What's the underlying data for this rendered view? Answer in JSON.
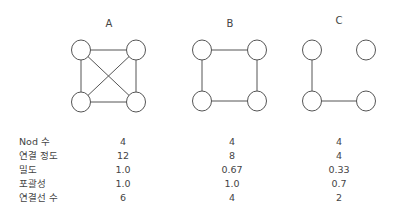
{
  "graphs": [
    {
      "label": "A",
      "nodes": [
        [
          81,
          50
        ],
        [
          136,
          50
        ],
        [
          81,
          102
        ],
        [
          136,
          102
        ]
      ],
      "edges": [
        [
          0,
          1
        ],
        [
          2,
          3
        ],
        [
          0,
          2
        ],
        [
          1,
          3
        ],
        [
          0,
          3
        ],
        [
          1,
          2
        ]
      ]
    },
    {
      "label": "B",
      "nodes": [
        [
          202,
          50
        ],
        [
          257,
          50
        ],
        [
          202,
          101
        ],
        [
          257,
          101
        ]
      ],
      "edges": [
        [
          0,
          1
        ],
        [
          2,
          3
        ],
        [
          0,
          2
        ],
        [
          1,
          3
        ]
      ]
    },
    {
      "label": "C",
      "nodes": [
        [
          312,
          50
        ],
        [
          366,
          50
        ],
        [
          312,
          101
        ],
        [
          366,
          101
        ]
      ],
      "edges": [
        [
          0,
          2
        ],
        [
          2,
          3
        ]
      ]
    }
  ],
  "table": {
    "rows": [
      {
        "label": "Nod 수",
        "values": [
          "4",
          "4",
          "4"
        ]
      },
      {
        "label": "연결 정도",
        "values": [
          "12",
          "8",
          "4"
        ]
      },
      {
        "label": "밀도",
        "values": [
          "1.0",
          "0.67",
          "0.33"
        ]
      },
      {
        "label": "포괄성",
        "values": [
          "1.0",
          "1.0",
          "0.7"
        ]
      },
      {
        "label": "연결선 수",
        "values": [
          "6",
          "4",
          "2"
        ]
      }
    ]
  },
  "colors": {
    "stroke": "#555555",
    "node_fill": "#ffffff",
    "text": "#444444"
  }
}
